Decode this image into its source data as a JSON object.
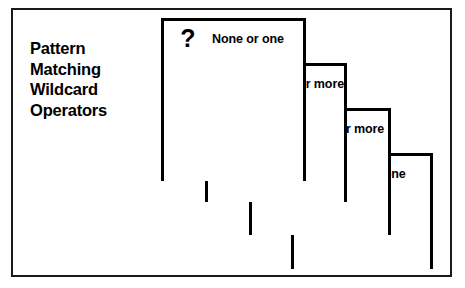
{
  "figure": {
    "title_lines": [
      "Pattern",
      "Matching",
      "Wildcard",
      "Operators"
    ],
    "frame_color": "#1a1a1a",
    "line_color": "#000000",
    "background": "#ffffff"
  },
  "cards": [
    {
      "symbol": "?",
      "symbol_name": "question-mark-wildcard",
      "label": "None or one"
    },
    {
      "symbol": "*",
      "symbol_name": "asterisk-wildcard",
      "label": "None or more"
    },
    {
      "symbol": "+",
      "symbol_name": "plus-wildcard",
      "label": "One or more"
    },
    {
      "symbol": "■",
      "symbol_name": "dot-wildcard",
      "label": "Any one"
    }
  ]
}
